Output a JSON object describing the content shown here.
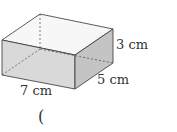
{
  "diagram": {
    "shape": "cuboid",
    "labels": {
      "height": "3 cm",
      "depth": "5 cm",
      "length": "7 cm"
    },
    "answer_bracket": "("
  },
  "colors": {
    "front_face": "#d9d9d9",
    "side_face": "#c4c4c4",
    "top_face": "#f7f7f7",
    "edge": "#333333"
  }
}
